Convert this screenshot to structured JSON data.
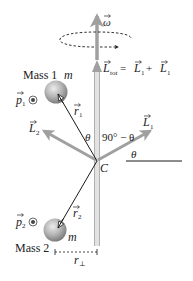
{
  "figure": {
    "colors": {
      "vector_gray": "#a0a0a0",
      "rod_gray": "#b8b8b8",
      "line_black": "#1a1a1a",
      "sphere_light": "#e6e6e6",
      "sphere_dark": "#8c8c8c",
      "background": "#ffffff"
    }
  },
  "labels": {
    "omega": "ω",
    "l_tot_main": "L",
    "l_tot_sub": "tot",
    "l_tot_eq": " = ",
    "l_tot_rhs1": "L",
    "l_tot_rhs1_sub": "1",
    "l_tot_plus": " + ",
    "l_tot_rhs2": "L",
    "l_tot_rhs2_sub": "1",
    "mass1": "Mass 1",
    "mass2": "Mass 2",
    "m1": "m",
    "m2": "m",
    "p1": "p",
    "p1_sub": "1",
    "p2": "p",
    "p2_sub": "2",
    "r1": "r",
    "r1_sub": "1",
    "r2": "r",
    "r2_sub": "2",
    "L1": "L",
    "L1_sub": "1",
    "L2": "L",
    "L2_sub": "2",
    "theta_left": "θ",
    "ninety_minus_theta": "90° − θ",
    "theta_right": "θ",
    "pivot": "C",
    "r_perp": "r",
    "r_perp_sub": "⊥"
  },
  "icons": {
    "p_out_of_page": "dot-in-circle-icon",
    "rotation_direction": "dashed-ellipse-arrow-icon"
  }
}
